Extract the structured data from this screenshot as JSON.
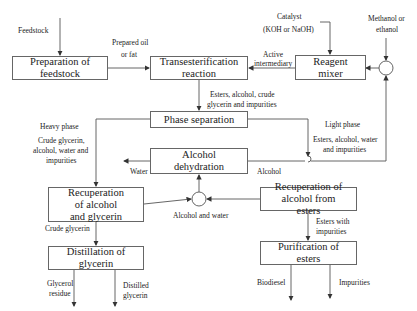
{
  "diagram": {
    "type": "process-flowchart",
    "boxes": {
      "prep": "Preparation of feedstock",
      "trans": "Transesterification reaction",
      "reagent": "Reagent mixer",
      "phase": "Phase separation",
      "dehyd": "Alcohol dehydration",
      "recup_ag": "Recuperation of alcohol and glycerin",
      "recup_ae": "Recuperation of alcohol from esters",
      "distill": "Distillation of glycerin",
      "purif": "Purification of esters"
    },
    "labels": {
      "feedstock": "Feedstock",
      "prepared_oil": "Prepared oil",
      "or_fat": "or fat",
      "catalyst": "Catalyst",
      "koh_naoh": "(KOH or NaOH)",
      "methanol": "Methanol or",
      "ethanol": "ethanol",
      "active": "Active",
      "intermediary": "intermediary",
      "esters_alc_1": "Esters, alcohol, crude",
      "esters_alc_2": "glycerin and impurities",
      "heavy_phase": "Heavy phase",
      "crude_glyc_1": "Crude glycerin,",
      "crude_glyc_2": "alcohol, water and",
      "crude_glyc_3": "impurities",
      "light_phase": "Light phase",
      "light_1": "Esters, alcohol, water",
      "light_2": "and impurities",
      "water": "Water",
      "alcohol": "Alcohol",
      "alcohol_water": "Alcohol and water",
      "crude_glycerin": "Crude glycerin",
      "esters_with": "Esters with",
      "impurities_1": "impurities",
      "glycerol": "Glycerol",
      "residue": "residue",
      "distilled": "Distilled",
      "glycerin": "glycerin",
      "biodiesel": "Biodiesel",
      "impurities_out": "Impurities"
    }
  }
}
